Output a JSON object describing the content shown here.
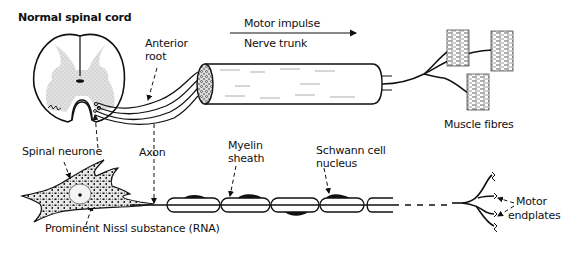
{
  "title": "Normal spinal cord",
  "labels": {
    "anterior_root_1": "Anterior",
    "anterior_root_2": "root",
    "motor_impulse": "Motor impulse",
    "nerve_trunk": "Nerve trunk",
    "muscle_fibres": "Muscle fibres",
    "spinal_neurone": "Spinal neurone",
    "axon": "Axon",
    "myelin_1": "Myelin",
    "myelin_2": "sheath",
    "schwann_1": "Schwann cell",
    "schwann_2": "nucleus",
    "motor_endplates_1": "Motor",
    "motor_endplates_2": "endplates",
    "nissl": "Prominent Nissl substance (RNA)"
  },
  "colors": {
    "ink": "#111111",
    "grey_matter": "#d9d9d9",
    "background": "#ffffff"
  }
}
